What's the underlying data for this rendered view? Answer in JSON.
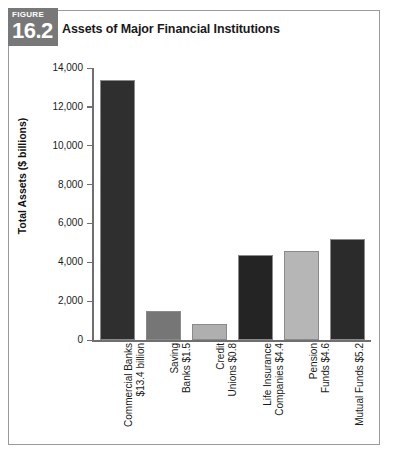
{
  "figure": {
    "badge_word": "FIGURE",
    "badge_number": "16.2",
    "title": "Assets of Major Financial Institutions"
  },
  "chart_data": {
    "type": "bar",
    "title": "Assets of Major Financial Institutions",
    "xlabel": "",
    "ylabel": "Total Assets ($ billions)",
    "ylim": [
      0,
      14000
    ],
    "ytick_labels": [
      "14,000",
      "12,000",
      "10,000",
      "8,000",
      "6,000",
      "4,000",
      "2,000",
      "0"
    ],
    "ytick_values": [
      14000,
      12000,
      10000,
      8000,
      6000,
      4000,
      2000,
      0
    ],
    "grid": false,
    "legend": "none",
    "categories": [
      "Commercial Banks\n$13.4 billion",
      "Saving\nBanks $1.5",
      "Credit\nUnions $0.8",
      "Life Insurance\nCompanies $4.4",
      "Pension\nFunds $4.6",
      "Mutual Funds $5.2"
    ],
    "values": [
      13400,
      1500,
      800,
      4400,
      4600,
      5200
    ],
    "bar_colors": [
      "#2f2f2f",
      "#767676",
      "#afafaf",
      "#242424",
      "#b6b6b6",
      "#2b2b2b"
    ]
  },
  "colors": {
    "badge_background": "#787878",
    "axis": "#6f6f6f",
    "frame_border": "#9a9a9a",
    "text": "#1a1a1a"
  }
}
